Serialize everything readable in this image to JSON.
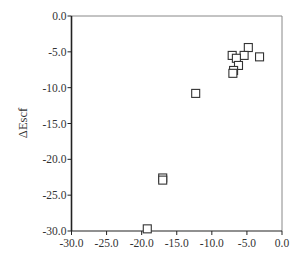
{
  "chart_data": {
    "type": "scatter",
    "title": "",
    "xlabel": "",
    "ylabel": "ΔEscf",
    "xlim": [
      -30.0,
      0.0
    ],
    "ylim": [
      -30.0,
      0.0
    ],
    "x_ticks": [
      "-30.0",
      "-25.0",
      "-20.0",
      "-15.0",
      "-10.0",
      "-5.0",
      "0.0"
    ],
    "y_ticks": [
      "0.0",
      "-5.0",
      "-10.0",
      "-15.0",
      "-20.0",
      "-25.0",
      "-30.0"
    ],
    "grid": false,
    "legend": null,
    "marker": "open-square",
    "series": [
      {
        "name": "points",
        "points": [
          {
            "x": -4.8,
            "y": -4.4
          },
          {
            "x": -3.2,
            "y": -5.7
          },
          {
            "x": -5.4,
            "y": -5.5
          },
          {
            "x": -7.1,
            "y": -5.5
          },
          {
            "x": -6.5,
            "y": -5.9
          },
          {
            "x": -6.2,
            "y": -6.9
          },
          {
            "x": -6.9,
            "y": -7.6
          },
          {
            "x": -7.0,
            "y": -8.0
          },
          {
            "x": -12.3,
            "y": -10.8
          },
          {
            "x": -17.0,
            "y": -22.6
          },
          {
            "x": -17.0,
            "y": -22.9
          },
          {
            "x": -19.2,
            "y": -29.7
          }
        ]
      }
    ]
  },
  "colors": {
    "axis": "#222222",
    "frame": "#888888",
    "marker": "#333333",
    "text": "#333333"
  }
}
